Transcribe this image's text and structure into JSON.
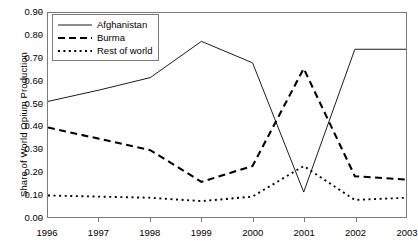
{
  "chart_data": {
    "type": "line",
    "title": "",
    "subtitle": "",
    "xlabel": "",
    "ylabel": "Share of World Opium Production",
    "x": [
      "1996",
      "1997",
      "1998",
      "1999",
      "2000",
      "2001",
      "2002",
      "2003"
    ],
    "categories": [
      "1996",
      "1997",
      "1998",
      "1999",
      "2000",
      "2001",
      "2002",
      "2003"
    ],
    "xlim": [
      "1996",
      "2003"
    ],
    "ylim": [
      0.0,
      0.9
    ],
    "ytick_labels": [
      "0.00",
      "0.10",
      "0.20",
      "0.30",
      "0.40",
      "0.50",
      "0.60",
      "0.70",
      "0.80",
      "0.90"
    ],
    "ytick_values": [
      0.0,
      0.1,
      0.2,
      0.3,
      0.4,
      0.5,
      0.6,
      0.7,
      0.8,
      0.9
    ],
    "xtick_labels": [
      "1996",
      "1997",
      "1998",
      "1999",
      "2000",
      "2001",
      "2002",
      "2003"
    ],
    "grid": false,
    "legend_position": "top-left",
    "series": [
      {
        "name": "Afghanistan",
        "style": "solid",
        "color": "#000000",
        "values": [
          0.51,
          0.56,
          0.615,
          0.775,
          0.68,
          0.11,
          0.74,
          0.74
        ]
      },
      {
        "name": "Burma",
        "style": "dashed",
        "color": "#000000",
        "values": [
          0.395,
          0.345,
          0.295,
          0.155,
          0.225,
          0.655,
          0.18,
          0.165
        ]
      },
      {
        "name": "Rest of world",
        "style": "dotted",
        "color": "#000000",
        "values": [
          0.095,
          0.09,
          0.085,
          0.07,
          0.09,
          0.225,
          0.075,
          0.085
        ]
      }
    ]
  },
  "legend": {
    "entries": [
      {
        "label": "Afghanistan"
      },
      {
        "label": "Burma"
      },
      {
        "label": "Rest of world"
      }
    ]
  },
  "axes": {
    "y_axis_title": "Share of World Opium Production"
  },
  "colors": {
    "line": "#000000",
    "axis": "#7a7a7a",
    "background": "#ffffff"
  }
}
